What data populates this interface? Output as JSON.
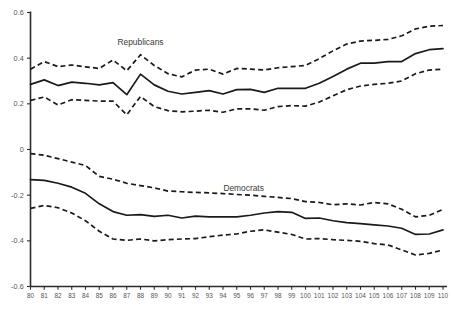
{
  "chart_data": {
    "type": "line",
    "title": "",
    "subtitle": "",
    "xlabel": "",
    "ylabel": "",
    "xlim": [
      80,
      110
    ],
    "ylim": [
      -0.6,
      0.6
    ],
    "grid": false,
    "legend_position": "inline-annotation",
    "x": [
      80,
      81,
      82,
      83,
      84,
      85,
      86,
      87,
      88,
      89,
      90,
      91,
      92,
      93,
      94,
      95,
      96,
      97,
      98,
      99,
      100,
      101,
      102,
      103,
      104,
      105,
      106,
      107,
      108,
      109,
      110
    ],
    "xtick_labels": [
      "80",
      "81",
      "82",
      "83",
      "84",
      "85",
      "86",
      "87",
      "88",
      "89",
      "90",
      "91",
      "92",
      "93",
      "94",
      "95",
      "96",
      "97",
      "98",
      "99",
      "100",
      "101",
      "102",
      "103",
      "104",
      "105",
      "106",
      "107",
      "108",
      "109",
      "110"
    ],
    "ytick_labels": [
      "0.6",
      "0.4",
      "0.2",
      "0",
      "-0.2",
      "-0.4",
      "-0.6"
    ],
    "ytick_values": [
      0.6,
      0.4,
      0.2,
      0,
      -0.2,
      -0.4,
      -0.6
    ],
    "annotations": [
      {
        "text": "Republicans",
        "x": 88.0,
        "y": 0.465
      },
      {
        "text": "Democrats",
        "x": 95.5,
        "y": -0.175
      }
    ],
    "series": [
      {
        "name": "Republicans",
        "style": "solid",
        "role": "mean",
        "values": [
          0.285,
          0.305,
          0.28,
          0.295,
          0.29,
          0.283,
          0.293,
          0.24,
          0.33,
          0.283,
          0.255,
          0.243,
          0.25,
          0.258,
          0.243,
          0.262,
          0.263,
          0.25,
          0.268,
          0.268,
          0.268,
          0.29,
          0.32,
          0.352,
          0.378,
          0.378,
          0.385,
          0.385,
          0.42,
          0.437,
          0.442
        ]
      },
      {
        "name": "Republicans upper CI",
        "style": "dashed",
        "role": "upper",
        "values": [
          0.352,
          0.385,
          0.363,
          0.37,
          0.362,
          0.355,
          0.392,
          0.345,
          0.415,
          0.368,
          0.332,
          0.318,
          0.348,
          0.352,
          0.33,
          0.355,
          0.352,
          0.348,
          0.358,
          0.363,
          0.368,
          0.398,
          0.432,
          0.462,
          0.475,
          0.478,
          0.482,
          0.498,
          0.528,
          0.54,
          0.543
        ]
      },
      {
        "name": "Republicans lower CI",
        "style": "dashed",
        "role": "lower",
        "values": [
          0.215,
          0.23,
          0.195,
          0.218,
          0.215,
          0.212,
          0.212,
          0.152,
          0.232,
          0.188,
          0.17,
          0.165,
          0.168,
          0.172,
          0.163,
          0.178,
          0.178,
          0.172,
          0.188,
          0.192,
          0.19,
          0.208,
          0.235,
          0.262,
          0.278,
          0.285,
          0.29,
          0.3,
          0.332,
          0.348,
          0.352
        ]
      },
      {
        "name": "Democrats",
        "style": "solid",
        "role": "mean",
        "values": [
          -0.132,
          -0.135,
          -0.148,
          -0.165,
          -0.192,
          -0.238,
          -0.272,
          -0.288,
          -0.285,
          -0.293,
          -0.288,
          -0.3,
          -0.292,
          -0.295,
          -0.295,
          -0.295,
          -0.288,
          -0.278,
          -0.272,
          -0.275,
          -0.302,
          -0.3,
          -0.312,
          -0.32,
          -0.325,
          -0.33,
          -0.335,
          -0.345,
          -0.372,
          -0.37,
          -0.352
        ]
      },
      {
        "name": "Democrats upper CI",
        "style": "dashed",
        "role": "upper",
        "values": [
          -0.018,
          -0.025,
          -0.04,
          -0.055,
          -0.07,
          -0.118,
          -0.13,
          -0.148,
          -0.158,
          -0.168,
          -0.182,
          -0.185,
          -0.188,
          -0.19,
          -0.193,
          -0.197,
          -0.2,
          -0.205,
          -0.21,
          -0.215,
          -0.228,
          -0.232,
          -0.242,
          -0.238,
          -0.243,
          -0.232,
          -0.238,
          -0.262,
          -0.295,
          -0.288,
          -0.262
        ]
      },
      {
        "name": "Democrats lower CI",
        "style": "dashed",
        "role": "lower",
        "values": [
          -0.258,
          -0.245,
          -0.255,
          -0.278,
          -0.312,
          -0.358,
          -0.392,
          -0.398,
          -0.392,
          -0.4,
          -0.395,
          -0.392,
          -0.39,
          -0.382,
          -0.375,
          -0.37,
          -0.358,
          -0.352,
          -0.362,
          -0.372,
          -0.392,
          -0.39,
          -0.395,
          -0.398,
          -0.402,
          -0.412,
          -0.418,
          -0.44,
          -0.462,
          -0.455,
          -0.44
        ]
      }
    ]
  },
  "axes": {
    "y_axis_name": "coefficient-axis",
    "x_axis_name": "congress-axis"
  }
}
